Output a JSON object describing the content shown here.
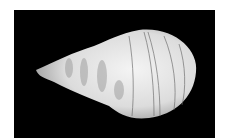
{
  "image": {
    "subject": "seashell",
    "description": "White spiral gastropod shell on black background",
    "colors": {
      "background": "#000000",
      "margin": "#ffffff",
      "shell": "#e8e8e8",
      "stripes": "#555555"
    }
  }
}
